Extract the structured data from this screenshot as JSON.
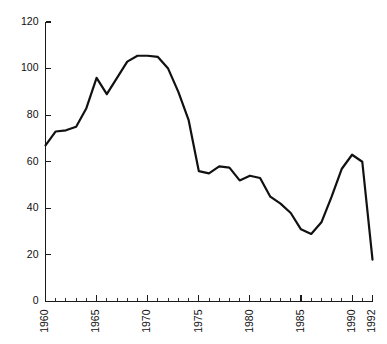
{
  "chart_data": {
    "type": "line",
    "title": "",
    "subtitle": "",
    "xlabel": "",
    "ylabel": "",
    "xlim": [
      1960,
      1992
    ],
    "ylim": [
      0,
      120
    ],
    "grid": false,
    "legend": null,
    "y_ticks": [
      0,
      20,
      40,
      60,
      80,
      100,
      120
    ],
    "y_tick_labels": [
      "0",
      "20",
      "40",
      "60",
      "80",
      "100",
      "120"
    ],
    "x_ticks": [
      1960,
      1965,
      1970,
      1975,
      1980,
      1985,
      1990,
      1992
    ],
    "x_tick_labels": [
      "1960",
      "1965",
      "1970",
      "1975",
      "1980",
      "1985",
      "1990",
      "1992"
    ],
    "x_minor_tick_step": 1,
    "x_label_rotation": 90,
    "line_color": "#111111",
    "line_width": 2.2,
    "x": [
      1960,
      1961,
      1962,
      1963,
      1964,
      1965,
      1966,
      1967,
      1968,
      1969,
      1970,
      1971,
      1972,
      1973,
      1974,
      1975,
      1976,
      1977,
      1978,
      1979,
      1980,
      1981,
      1982,
      1983,
      1984,
      1985,
      1986,
      1987,
      1988,
      1989,
      1990,
      1991,
      1992
    ],
    "values": [
      67,
      73,
      73.5,
      75,
      83,
      96,
      89,
      96,
      103,
      105.5,
      105.5,
      105,
      100,
      90,
      78,
      56,
      55,
      58,
      57.5,
      52,
      54,
      53,
      45,
      42,
      38,
      31,
      29,
      34,
      45,
      57,
      63,
      60,
      18
    ],
    "series": [
      {
        "name": "value",
        "values": [
          67,
          73,
          73.5,
          75,
          83,
          96,
          89,
          96,
          103,
          105.5,
          105.5,
          105,
          100,
          90,
          78,
          56,
          55,
          58,
          57.5,
          52,
          54,
          53,
          45,
          42,
          38,
          31,
          29,
          34,
          45,
          57,
          63,
          60,
          18
        ]
      }
    ]
  },
  "axes": {
    "y_axis_name": "y-axis",
    "x_axis_name": "x-axis"
  }
}
